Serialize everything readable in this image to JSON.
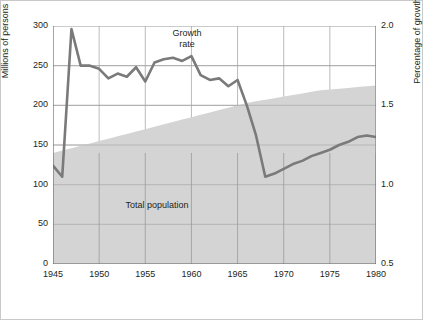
{
  "figure": {
    "border_color": "#c9c9c9",
    "background": "#ffffff"
  },
  "chart_data": {
    "type": "line",
    "title": "",
    "xlabel": "",
    "grid": true,
    "legend_position": "inline-annotations",
    "x": [
      1945,
      1946,
      1947,
      1948,
      1949,
      1950,
      1951,
      1952,
      1953,
      1954,
      1955,
      1956,
      1957,
      1958,
      1959,
      1960,
      1961,
      1962,
      1963,
      1964,
      1965,
      1966,
      1967,
      1968,
      1969,
      1970,
      1971,
      1972,
      1973,
      1974,
      1975,
      1976,
      1977,
      1978,
      1979,
      1980
    ],
    "xlim": [
      1945,
      1980
    ],
    "xticks": [
      1945,
      1950,
      1955,
      1960,
      1965,
      1970,
      1975,
      1980
    ],
    "xtick_labels": [
      "1945",
      "1950",
      "1955",
      "1960",
      "1965",
      "1970",
      "1975",
      "1980"
    ],
    "left_axis": {
      "label": "Millions of persons",
      "ylim": [
        0,
        300
      ],
      "ticks": [
        0,
        50,
        100,
        150,
        200,
        250,
        300
      ],
      "tick_labels": [
        "0",
        "50",
        "100",
        "150",
        "200",
        "250",
        "300"
      ]
    },
    "right_axis": {
      "label": "Percentage of growth",
      "ylim": [
        0.5,
        2.0
      ],
      "ticks": [
        0.5,
        1.0,
        1.5,
        2.0
      ],
      "tick_labels": [
        "0.5",
        "1.0",
        "1.5",
        "2.0"
      ]
    },
    "series": [
      {
        "name": "Total population",
        "type": "area",
        "axis": "left",
        "color": "#d4d4d4",
        "values": [
          140,
          143,
          146,
          149,
          152,
          155,
          158,
          161,
          164,
          167,
          170,
          173,
          176,
          179,
          182,
          185,
          188,
          191,
          194,
          197,
          200,
          203,
          205,
          207,
          209,
          211,
          213,
          215,
          217,
          219,
          220,
          221,
          222,
          223,
          224,
          225
        ]
      },
      {
        "name": "Growth rate",
        "type": "line",
        "axis": "right",
        "color": "#7a7a7a",
        "units": "percent",
        "values": [
          1.12,
          1.05,
          1.98,
          1.75,
          1.75,
          1.73,
          1.67,
          1.7,
          1.68,
          1.74,
          1.65,
          1.77,
          1.79,
          1.8,
          1.78,
          1.81,
          1.69,
          1.66,
          1.67,
          1.62,
          1.66,
          1.5,
          1.31,
          1.05,
          1.07,
          1.1,
          1.13,
          1.15,
          1.18,
          1.2,
          1.22,
          1.25,
          1.27,
          1.3,
          1.31,
          1.3
        ]
      }
    ],
    "annotations": [
      {
        "text": "Growth rate",
        "x": 1956.5,
        "y_right": 1.93
      },
      {
        "text": "Total population",
        "x": 1952.5,
        "y_left": 78
      }
    ]
  },
  "labels": {
    "growth_line1": "Growth",
    "growth_line2": "rate",
    "population": "Total population",
    "left_axis_title": "Millions of persons",
    "right_axis_title": "Percentage of growth"
  }
}
